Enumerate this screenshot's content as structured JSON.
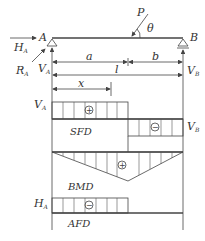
{
  "labels": {
    "force_P": "P",
    "angle": "θ",
    "support_A": "A",
    "support_B": "B",
    "H_A_main": "H",
    "H_A_sub": "A",
    "R_A_main": "R",
    "R_A_sub": "A",
    "V_A_main": "V",
    "V_A_sub": "A",
    "V_B_main": "V",
    "V_B_sub": "B",
    "dim_a": "a",
    "dim_b": "b",
    "dim_l": "l",
    "dim_x": "x",
    "sfd_VA_main": "V",
    "sfd_VA_sub": "A",
    "sfd_VB_main": "V",
    "sfd_VB_sub": "B",
    "afd_HA_main": "H",
    "afd_HA_sub": "A",
    "sfd": "SFD",
    "bmd": "BMD",
    "afd": "AFD",
    "plus": "+",
    "minus": "−"
  },
  "colors": {
    "line": "#444444",
    "text": "#333333",
    "background": "#ffffff"
  }
}
